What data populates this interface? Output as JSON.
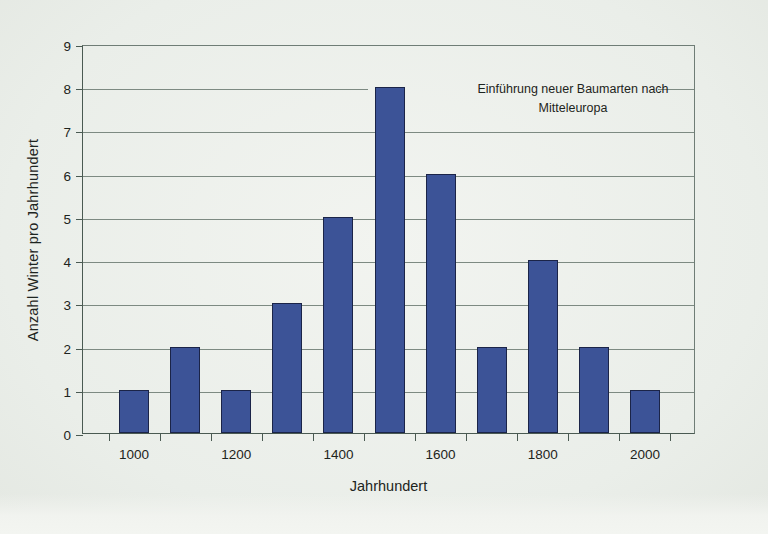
{
  "chart_data": {
    "type": "bar",
    "title": "",
    "xlabel": "Jahrhundert",
    "ylabel": "Anzahl Winter pro Jahrhundert",
    "categories": [
      "1000",
      "1100",
      "1200",
      "1300",
      "1400",
      "1500",
      "1600",
      "1700",
      "1800",
      "1900",
      "2000"
    ],
    "values": [
      1,
      2,
      1,
      3,
      5,
      8,
      6,
      2,
      4,
      2,
      1
    ],
    "xtick_labels": [
      "1000",
      "1200",
      "1400",
      "1600",
      "1800",
      "2000"
    ],
    "ytick_labels": [
      "0",
      "1",
      "2",
      "3",
      "4",
      "5",
      "6",
      "7",
      "8",
      "9"
    ],
    "ylim": [
      0,
      9
    ],
    "grid": true,
    "legend": "none",
    "annotations": [
      {
        "line1": "Einführung neuer Baumarten nach",
        "line2": "Mitteleuropa"
      }
    ],
    "bar_color": "#3c5397",
    "bar_edge_color": "#1b2448",
    "grid_color": "#7d8a82",
    "axis_color": "#4a5a52",
    "background_color": "#eef1ed"
  },
  "page": {
    "bottom_caption": ""
  }
}
